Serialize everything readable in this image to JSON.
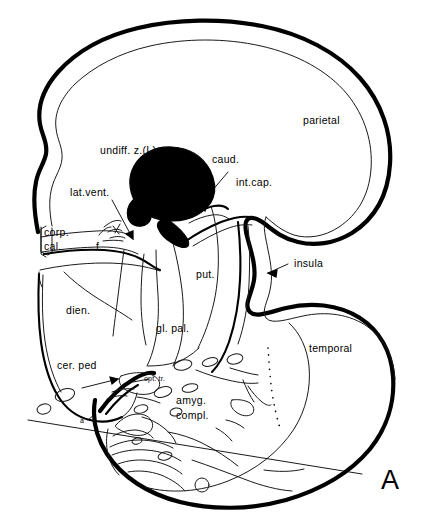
{
  "figure": {
    "panel_letter": "A",
    "background_color": "#ffffff",
    "ink_color": "#000000",
    "type": "line-drawing"
  },
  "labels": {
    "parietal": "parietal",
    "undiff_z": "undiff. z.(L)",
    "caud": "caud.",
    "int_cap": "int.cap.",
    "lat_vent": "lat.vent.",
    "corp_cal_line1": "corp.",
    "corp_cal_line2": "cal.",
    "fornix": "f.",
    "insula": "insula",
    "put": "put.",
    "dien": "dien.",
    "gl_pal": "gl. pal.",
    "temporal": "temporal",
    "cer_ped": "cer. ped",
    "opt_tr": "opt. tr.",
    "amyg_line1": "amyg.",
    "amyg_line2": "compl.",
    "plane_a_prime": "a'",
    "plane_a": "a"
  },
  "regions": {
    "filled_structure": {
      "name": "undiff. z.(L)",
      "fill": "#000000",
      "description": "solid black oval nucleus"
    },
    "cortex_outline": {
      "stroke": "#000000",
      "description": "thick outer cortical boundary"
    }
  },
  "annotations": {
    "insula_arrow": "arrow pointing to insular cortex",
    "cer_ped_arrow": "arrow pointing to cerebral peduncle",
    "caud_arrow": "arrow pointing to caudate nucleus",
    "lat_vent_arrow": "arrow pointing to lateral ventricle",
    "section_plane_line": "line from a' to a marking plane of section",
    "dotted_boundary": "dotted line at medial temporal boundary"
  }
}
